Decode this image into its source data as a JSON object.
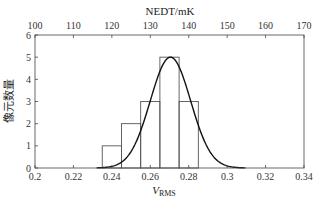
{
  "chart_data": {
    "type": "bar",
    "subtype": "histogram_with_normal_fit",
    "xlabel": "V",
    "xlabel_subscript": "RMS",
    "ylabel": "像元数量",
    "top_xlabel": "NEDT/mK",
    "xlim": [
      0.2,
      0.34
    ],
    "ylim": [
      0,
      6
    ],
    "x_ticks": [
      "0.2",
      "0.22",
      "0.24",
      "0.26",
      "0.28",
      "0.3",
      "0.32",
      "0.34"
    ],
    "x_tick_values": [
      0.2,
      0.22,
      0.24,
      0.26,
      0.28,
      0.3,
      0.32,
      0.34
    ],
    "y_ticks": [
      "0",
      "1",
      "2",
      "3",
      "4",
      "5",
      "6"
    ],
    "top_x_ticks": [
      "100",
      "110",
      "120",
      "130",
      "140",
      "150",
      "160",
      "170"
    ],
    "bins": [
      {
        "start": 0.235,
        "end": 0.245,
        "count": 1
      },
      {
        "start": 0.245,
        "end": 0.255,
        "count": 2
      },
      {
        "start": 0.255,
        "end": 0.265,
        "count": 3
      },
      {
        "start": 0.265,
        "end": 0.275,
        "count": 5
      },
      {
        "start": 0.275,
        "end": 0.285,
        "count": 3
      }
    ],
    "categories": [
      "0.24",
      "0.25",
      "0.26",
      "0.27",
      "0.28"
    ],
    "values": [
      1,
      2,
      3,
      5,
      3
    ],
    "fit_curve": {
      "type": "normal",
      "mean": 0.2705,
      "peak": 5.0,
      "sigma": 0.0105
    },
    "grid": false,
    "legend": null
  },
  "colors": {
    "bar_edge": "#555555",
    "curve": "#111111",
    "axis": "#444444"
  }
}
